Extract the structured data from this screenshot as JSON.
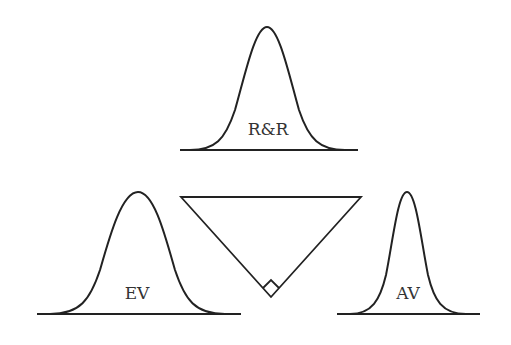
{
  "diagram": {
    "title": "",
    "nodes": [
      {
        "id": "rr",
        "label": "R&R",
        "shape": "normal-distribution",
        "position": "top"
      },
      {
        "id": "ev",
        "label": "EV",
        "shape": "normal-distribution",
        "position": "bottom-left"
      },
      {
        "id": "av",
        "label": "AV",
        "shape": "normal-distribution",
        "position": "bottom-right"
      }
    ],
    "center_shape": {
      "type": "right-triangle-inverted",
      "right_angle_marker": true
    },
    "colors": {
      "stroke": "#222222",
      "text": "#333333",
      "background": "#ffffff"
    }
  }
}
